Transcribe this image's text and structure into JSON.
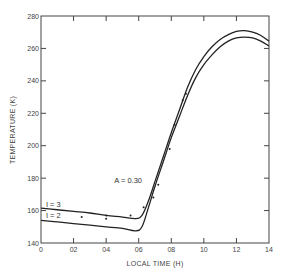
{
  "chart_data": {
    "type": "line",
    "title": "",
    "xlabel": "LOCAL TIME (H)",
    "ylabel": "TEMPERATURE (K)",
    "xlim": [
      0,
      14
    ],
    "ylim": [
      140,
      280
    ],
    "xticks": [
      0,
      2,
      4,
      6,
      8,
      10,
      12,
      14
    ],
    "xtick_labels": [
      "0",
      "02",
      "04",
      "06",
      "08",
      "10",
      "12",
      "14"
    ],
    "yticks": [
      140,
      160,
      180,
      200,
      220,
      240,
      260,
      280
    ],
    "ytick_labels": [
      "140",
      "160",
      "180",
      "200",
      "220",
      "240",
      "260",
      "280"
    ],
    "grid": false,
    "annotations": [
      {
        "text": "A = 0.30",
        "x": 4.5,
        "y": 177
      },
      {
        "text": "I = 3",
        "x": 0.3,
        "y": 162.5
      },
      {
        "text": "I = 2",
        "x": 0.3,
        "y": 155.5
      }
    ],
    "series": [
      {
        "name": "I = 3",
        "x": [
          0,
          1,
          2,
          3,
          4,
          5,
          5.8,
          6.2,
          6.6,
          7.0,
          7.5,
          8.0,
          8.5,
          9.0,
          9.5,
          10.0,
          10.5,
          11.0,
          11.5,
          12.0,
          12.5,
          13.0,
          13.5,
          14.0
        ],
        "y": [
          161.5,
          160.5,
          159.5,
          158.5,
          157,
          156,
          155,
          157,
          166,
          178,
          193,
          208,
          222,
          236,
          247,
          255,
          261,
          265.5,
          268.5,
          270.5,
          271,
          270,
          268,
          264.5
        ]
      },
      {
        "name": "I = 2",
        "x": [
          0,
          1,
          2,
          3,
          4,
          5,
          5.8,
          6.2,
          6.6,
          7.0,
          7.5,
          8.0,
          8.5,
          9.0,
          9.5,
          10.0,
          10.5,
          11.0,
          11.5,
          12.0,
          12.5,
          13.0,
          13.5,
          14.0
        ],
        "y": [
          154,
          153,
          152,
          151,
          150,
          149,
          147.5,
          150,
          162,
          175,
          190,
          205,
          218,
          231,
          242,
          250,
          256,
          261,
          264.5,
          266.5,
          267,
          266.5,
          264.5,
          261.5
        ]
      },
      {
        "name": "observations",
        "type": "scatter",
        "x": [
          2.5,
          4.0,
          4.0,
          5.5,
          6.3,
          6.9,
          7.2,
          7.9,
          8.2,
          8.7,
          8.9
        ],
        "y": [
          156,
          157,
          155,
          157,
          162,
          168,
          176,
          198,
          213,
          228,
          232
        ]
      }
    ]
  }
}
